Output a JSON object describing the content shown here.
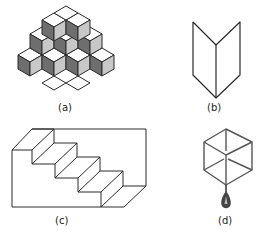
{
  "figure": {
    "panels": [
      {
        "id": "a",
        "label": "(a)",
        "description": "Stack of isometric cubes with white, dark-gray and light-gray faces (reversible figure)"
      },
      {
        "id": "b",
        "label": "(b)",
        "description": "Folded card / open book ambiguous figure"
      },
      {
        "id": "c",
        "label": "(c)",
        "description": "Schröder staircase"
      },
      {
        "id": "d",
        "label": "(d)",
        "description": "Necker cube with a tassel hanging from a vertex"
      }
    ]
  },
  "colors": {
    "line": "#2a2a2a",
    "top_face": "#ffffff",
    "dark_face": "#6e6e6e",
    "light_face": "#c8c8c8"
  }
}
